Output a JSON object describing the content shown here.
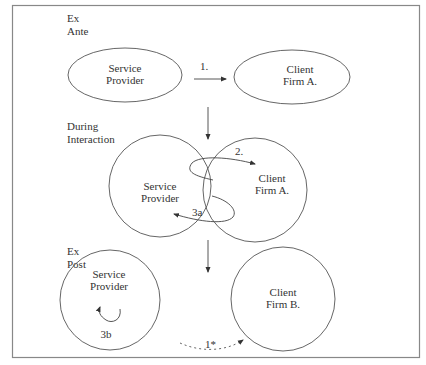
{
  "phases": {
    "ex_ante": {
      "line1": "Ex",
      "line2": "Ante"
    },
    "during": {
      "line1": "During",
      "line2": "Interaction"
    },
    "ex_post": {
      "line1": "Ex",
      "line2": "Post"
    }
  },
  "nodes": {
    "sp_ante": {
      "line1": "Service",
      "line2": "Provider"
    },
    "client_a_ante": {
      "line1": "Client",
      "line2": "Firm A."
    },
    "sp_during": {
      "line1": "Service",
      "line2": "Provider"
    },
    "client_a_during": {
      "line1": "Client",
      "line2": "Firm A."
    },
    "sp_post": {
      "line1": "Service",
      "line2": "Provider"
    },
    "client_b_post": {
      "line1": "Client",
      "line2": "Firm B."
    }
  },
  "edges": {
    "e1": "1.",
    "e2": "2.",
    "e3a": "3a",
    "e3b": "3b",
    "e1star": "1*"
  },
  "colors": {
    "line": "#555555",
    "text": "#333333",
    "frame": "#888888"
  }
}
